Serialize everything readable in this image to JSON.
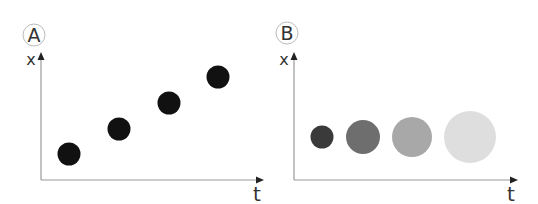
{
  "panels": [
    {
      "label": "A",
      "y_axis_label": "x",
      "x_axis_label": "t",
      "dots": [
        {
          "cx": 69,
          "cy": 154,
          "r": 11.5,
          "color": "#111111"
        },
        {
          "cx": 119,
          "cy": 129,
          "r": 11.5,
          "color": "#111111"
        },
        {
          "cx": 169,
          "cy": 103,
          "r": 11.5,
          "color": "#111111"
        },
        {
          "cx": 218,
          "cy": 77,
          "r": 11.5,
          "color": "#111111"
        }
      ]
    },
    {
      "label": "B",
      "y_axis_label": "x",
      "x_axis_label": "t",
      "dots": [
        {
          "cx": 322,
          "cy": 137,
          "r": 11.5,
          "color": "#3a3a3a"
        },
        {
          "cx": 363,
          "cy": 137,
          "r": 17,
          "color": "#6e6e6e"
        },
        {
          "cx": 412,
          "cy": 137,
          "r": 20,
          "color": "#a8a8a8"
        },
        {
          "cx": 470,
          "cy": 137,
          "r": 26,
          "color": "#dedede"
        }
      ]
    }
  ],
  "colors": {
    "axis": "#999999",
    "arrow": "#222222",
    "label_circle": "#bbbbbb"
  }
}
